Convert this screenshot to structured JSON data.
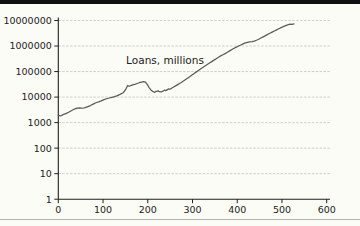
{
  "page": {
    "background_color": "#fcfcf6",
    "top_bar_color": "#101010",
    "bottom_divider_color": "#b2b2ae"
  },
  "chart_data": {
    "type": "line",
    "title": "",
    "series_label": "Loans, millions",
    "xlabel": "",
    "ylabel": "",
    "y_scale": "log",
    "xlim": [
      0,
      600
    ],
    "ylim": [
      1,
      10000000
    ],
    "x_ticks": [
      0,
      100,
      200,
      300,
      400,
      500,
      600
    ],
    "x_tick_labels": [
      "0",
      "100",
      "200",
      "300",
      "400",
      "500",
      "600"
    ],
    "y_ticks": [
      1,
      10,
      100,
      1000,
      10000,
      100000,
      1000000,
      10000000
    ],
    "y_tick_labels": [
      "1",
      "10",
      "100",
      "1000",
      "10000",
      "100000",
      "1000000",
      "10000000"
    ],
    "grid": "horizontal",
    "legend_position": "none",
    "line_color": "#5b5b5b",
    "grid_color": "#c5c5c1",
    "axis_color": "#1f1f1f",
    "series": [
      {
        "name": "Loans, millions",
        "points": [
          [
            0,
            1900
          ],
          [
            6,
            1850
          ],
          [
            12,
            2100
          ],
          [
            18,
            2300
          ],
          [
            24,
            2600
          ],
          [
            30,
            3000
          ],
          [
            36,
            3400
          ],
          [
            42,
            3700
          ],
          [
            48,
            3750
          ],
          [
            54,
            3650
          ],
          [
            60,
            3850
          ],
          [
            66,
            4250
          ],
          [
            72,
            4650
          ],
          [
            78,
            5300
          ],
          [
            84,
            6000
          ],
          [
            90,
            6500
          ],
          [
            96,
            7100
          ],
          [
            102,
            7900
          ],
          [
            108,
            8600
          ],
          [
            114,
            9200
          ],
          [
            120,
            9800
          ],
          [
            126,
            10400
          ],
          [
            132,
            11400
          ],
          [
            138,
            12800
          ],
          [
            144,
            14500
          ],
          [
            148,
            17000
          ],
          [
            152,
            22000
          ],
          [
            155,
            28500
          ],
          [
            158,
            26500
          ],
          [
            162,
            28000
          ],
          [
            166,
            30000
          ],
          [
            171,
            31500
          ],
          [
            176,
            34000
          ],
          [
            181,
            36500
          ],
          [
            186,
            38500
          ],
          [
            191,
            40000
          ],
          [
            195,
            38500
          ],
          [
            199,
            31000
          ],
          [
            203,
            23500
          ],
          [
            207,
            19000
          ],
          [
            212,
            16300
          ],
          [
            216,
            15400
          ],
          [
            219,
            16800
          ],
          [
            223,
            17600
          ],
          [
            226,
            16200
          ],
          [
            230,
            15900
          ],
          [
            234,
            17200
          ],
          [
            237,
            18600
          ],
          [
            240,
            17900
          ],
          [
            244,
            19600
          ],
          [
            247,
            21000
          ],
          [
            250,
            20300
          ],
          [
            254,
            22800
          ],
          [
            258,
            25000
          ],
          [
            263,
            28000
          ],
          [
            268,
            31500
          ],
          [
            273,
            35500
          ],
          [
            278,
            40500
          ],
          [
            283,
            46500
          ],
          [
            288,
            53500
          ],
          [
            293,
            61500
          ],
          [
            298,
            71000
          ],
          [
            303,
            82000
          ],
          [
            308,
            95000
          ],
          [
            313,
            110000
          ],
          [
            318,
            126000
          ],
          [
            323,
            145000
          ],
          [
            328,
            165000
          ],
          [
            333,
            188000
          ],
          [
            338,
            215000
          ],
          [
            343,
            245000
          ],
          [
            348,
            280000
          ],
          [
            353,
            320000
          ],
          [
            358,
            365000
          ],
          [
            363,
            410000
          ],
          [
            368,
            455000
          ],
          [
            373,
            505000
          ],
          [
            378,
            570000
          ],
          [
            383,
            645000
          ],
          [
            388,
            730000
          ],
          [
            393,
            820000
          ],
          [
            398,
            910000
          ],
          [
            403,
            1000000
          ],
          [
            408,
            1100000
          ],
          [
            413,
            1210000
          ],
          [
            418,
            1320000
          ],
          [
            423,
            1400000
          ],
          [
            428,
            1450000
          ],
          [
            433,
            1490000
          ],
          [
            438,
            1560000
          ],
          [
            443,
            1680000
          ],
          [
            448,
            1850000
          ],
          [
            453,
            2050000
          ],
          [
            458,
            2280000
          ],
          [
            463,
            2550000
          ],
          [
            468,
            2850000
          ],
          [
            473,
            3150000
          ],
          [
            478,
            3500000
          ],
          [
            483,
            3880000
          ],
          [
            488,
            4300000
          ],
          [
            493,
            4750000
          ],
          [
            498,
            5250000
          ],
          [
            503,
            5750000
          ],
          [
            508,
            6250000
          ],
          [
            513,
            6750000
          ],
          [
            518,
            7150000
          ],
          [
            522,
            7000000
          ],
          [
            527,
            7300000
          ]
        ]
      }
    ]
  }
}
